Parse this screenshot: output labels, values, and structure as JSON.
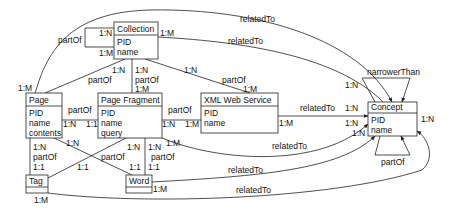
{
  "entities": {
    "collection": {
      "title": "Collection",
      "attrs": [
        "PID",
        "name"
      ]
    },
    "page": {
      "title": "Page",
      "attrs": [
        "PID",
        "name",
        "contents"
      ]
    },
    "page_fragment": {
      "title": "Page Fragment",
      "attrs": [
        "PID",
        "name",
        "query"
      ]
    },
    "xml_web_service": {
      "title": "XML Web Service",
      "attrs": [
        "PID",
        "name"
      ]
    },
    "concept": {
      "title": "Concept",
      "attrs": [
        "PID",
        "name"
      ]
    },
    "tag": {
      "title": "Tag",
      "attrs": []
    },
    "word": {
      "title": "Word",
      "attrs": []
    }
  },
  "relations": {
    "page_concept": {
      "label": "relatedTo"
    },
    "collection_concept": {
      "label": "relatedTo"
    },
    "collection_self": {
      "label": "partOf",
      "card_a": "1:N",
      "card_b": "1:M"
    },
    "collection_card_right": "1:M",
    "page_collection": {
      "label": "partOf",
      "card_top": "1:N",
      "card_bottom": "1:M"
    },
    "fragment_collection": {
      "label": "partOf",
      "card_top": "1:N",
      "card_bottom": "1:M"
    },
    "service_collection": {
      "label": "partOf",
      "card_top": "1:N",
      "card_bottom": "1:M"
    },
    "concept_narrower": {
      "label": "narrowerThan"
    },
    "concept_partof": {
      "label": "partOf"
    },
    "page_fragment_rel": {
      "label": "partOf",
      "card_a": "1:N",
      "card_b": "1:1"
    },
    "fragment_service_rel": {
      "label": "partOf",
      "card_a": "1:N",
      "card_b": "1:M"
    },
    "service_concept": {
      "label": "relatedTo",
      "card_a": "1:M",
      "card_b": "1:N"
    },
    "fragment_concept": {
      "label": "relatedTo",
      "card_b": "1:N"
    },
    "word_concept": {
      "label": "relatedTo",
      "card_b": "1:N"
    },
    "tag_concept": {
      "label": "relatedTo",
      "card_a": "1:M",
      "card_b": "1:N"
    },
    "word_card": "1:M",
    "concept_card_top": "1:N",
    "page_tag": {
      "label": "partOf",
      "card_a": "1:N",
      "card_b": "1:1"
    },
    "page_word": {
      "card_a": "1:N",
      "card_b": "1:1"
    },
    "fragment_tag": {
      "label": "partOf",
      "card_a": "1:N",
      "card_b": "1:1"
    },
    "fragment_word": {
      "label": "partOf",
      "card_a": "1:N",
      "card_b": "1:1",
      "card_c": "1:M"
    },
    "page_card_top": "1:M"
  }
}
